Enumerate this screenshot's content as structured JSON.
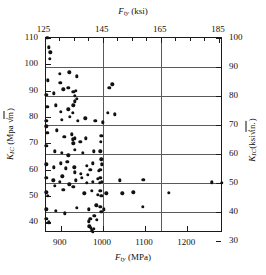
{
  "figure": {
    "top_axis_title_parts": {
      "sym": "F",
      "sub": "ty",
      "unit": " (ksi)"
    },
    "bottom_axis_title_parts": {
      "sym": "F",
      "sub": "ty",
      "unit": " (MPa)"
    },
    "left_axis_title_parts": {
      "sym": "K",
      "sub": "IC",
      "unit": " (Mpa ",
      "radical": "√",
      "radicand": "m",
      "close": ")"
    },
    "right_axis_title_parts": {
      "sym": "K",
      "sub": "IC",
      "unit": "(ksi",
      "radical": "√",
      "radicand": "in.",
      "close": ")"
    },
    "colors": {
      "frame": "#1a1a1a",
      "grid": "#5a5a5a",
      "marker": "#111111",
      "background": "#ffffff"
    }
  },
  "chart_data": {
    "type": "scatter",
    "title": "",
    "xlabel": "F_ty (MPa)",
    "ylabel": "K_IC (MPa √m)",
    "xlabel_top": "F_ty (ksi)",
    "ylabel_right": "K_IC (ksi√in.)",
    "grid": true,
    "legend": null,
    "xlim": [
      865,
      1285
    ],
    "ylim": [
      36,
      110
    ],
    "xlim_ksi": [
      125.5,
      186.4
    ],
    "ylim_ksiin": [
      32.8,
      100.1
    ],
    "xticks": [
      900,
      1000,
      1100,
      1200
    ],
    "xticklabels": [
      "900",
      "1000",
      "1100",
      "1200"
    ],
    "xticks_top_ksi": [
      125,
      145,
      165,
      185
    ],
    "xticklabels_top": [
      "125",
      "145",
      "165",
      "185"
    ],
    "xticks_top_minor_ksi": [
      130,
      135,
      140,
      150,
      155,
      160,
      170,
      175,
      180
    ],
    "yticks": [
      40,
      50,
      60,
      70,
      80,
      90,
      100,
      110
    ],
    "yticklabels": [
      "40",
      "50",
      "60",
      "70",
      "80",
      "90",
      "100",
      "110"
    ],
    "yticks_right_ksiin": [
      30,
      40,
      50,
      60,
      70,
      80,
      90,
      100
    ],
    "yticklabels_right": [
      "30",
      "40",
      "50",
      "60",
      "70",
      "80",
      "90",
      "100"
    ],
    "gridlines_h_ksiin": [
      40,
      50,
      60,
      70,
      80,
      90
    ],
    "gridlines_v_ksi": [
      145,
      165
    ],
    "unit_conversion": {
      "mpa_per_ksi": 6.895,
      "mparootm_per_ksirootin": 1.099
    },
    "points": [
      [
        868,
        110.0
      ],
      [
        872,
        106.5
      ],
      [
        875,
        104.5
      ],
      [
        874,
        102.0
      ],
      [
        870,
        94.0
      ],
      [
        898,
        96.5
      ],
      [
        899,
        93.0
      ],
      [
        920,
        97.0
      ],
      [
        938,
        95.5
      ],
      [
        866,
        88.5
      ],
      [
        884,
        89.0
      ],
      [
        906,
        90.5
      ],
      [
        918,
        91.0
      ],
      [
        930,
        89.5
      ],
      [
        933,
        88.0
      ],
      [
        934,
        86.0
      ],
      [
        936,
        90.0
      ],
      [
        938,
        87.0
      ],
      [
        1022,
        92.5
      ],
      [
        1015,
        91.0
      ],
      [
        868,
        84.0
      ],
      [
        888,
        84.5
      ],
      [
        900,
        82.0
      ],
      [
        918,
        83.0
      ],
      [
        928,
        81.5
      ],
      [
        930,
        84.5
      ],
      [
        866,
        78.5
      ],
      [
        902,
        79.0
      ],
      [
        922,
        80.0
      ],
      [
        940,
        78.5
      ],
      [
        958,
        79.5
      ],
      [
        982,
        78.5
      ],
      [
        1000,
        78.0
      ],
      [
        1012,
        81.5
      ],
      [
        1028,
        81.0
      ],
      [
        866,
        76.5
      ],
      [
        868,
        74.0
      ],
      [
        890,
        75.0
      ],
      [
        908,
        72.5
      ],
      [
        926,
        73.5
      ],
      [
        928,
        71.5
      ],
      [
        930,
        70.0
      ],
      [
        934,
        72.0
      ],
      [
        946,
        70.5
      ],
      [
        960,
        72.0
      ],
      [
        866,
        69.0
      ],
      [
        886,
        67.0
      ],
      [
        902,
        66.5
      ],
      [
        918,
        65.5
      ],
      [
        934,
        67.5
      ],
      [
        952,
        66.5
      ],
      [
        978,
        67.0
      ],
      [
        994,
        67.0
      ],
      [
        995,
        70.5
      ],
      [
        996,
        73.0
      ],
      [
        866,
        62.0
      ],
      [
        884,
        61.0
      ],
      [
        900,
        62.5
      ],
      [
        912,
        60.5
      ],
      [
        916,
        63.0
      ],
      [
        932,
        61.0
      ],
      [
        934,
        59.0
      ],
      [
        948,
        58.5
      ],
      [
        962,
        61.5
      ],
      [
        970,
        60.0
      ],
      [
        976,
        62.5
      ],
      [
        990,
        59.5
      ],
      [
        994,
        60.0
      ],
      [
        996,
        64.0
      ],
      [
        998,
        62.0
      ],
      [
        866,
        57.0
      ],
      [
        882,
        56.0
      ],
      [
        898,
        55.5
      ],
      [
        904,
        57.5
      ],
      [
        920,
        54.5
      ],
      [
        936,
        56.0
      ],
      [
        950,
        57.0
      ],
      [
        962,
        55.0
      ],
      [
        964,
        58.0
      ],
      [
        976,
        55.5
      ],
      [
        988,
        56.5
      ],
      [
        992,
        55.0
      ],
      [
        994,
        57.0
      ],
      [
        998,
        55.5
      ],
      [
        1040,
        56.0
      ],
      [
        1096,
        56.3
      ],
      [
        1258,
        55.3
      ],
      [
        1282,
        55.0
      ],
      [
        866,
        51.5
      ],
      [
        870,
        50.0
      ],
      [
        886,
        54.0
      ],
      [
        906,
        52.5
      ],
      [
        930,
        53.5
      ],
      [
        956,
        51.0
      ],
      [
        974,
        52.0
      ],
      [
        988,
        50.5
      ],
      [
        994,
        52.0
      ],
      [
        996,
        50.0
      ],
      [
        1008,
        51.0
      ],
      [
        1046,
        51.0
      ],
      [
        1072,
        51.5
      ],
      [
        1156,
        51.3
      ],
      [
        866,
        45.0
      ],
      [
        888,
        44.5
      ],
      [
        910,
        43.5
      ],
      [
        938,
        45.5
      ],
      [
        966,
        45.0
      ],
      [
        984,
        46.5
      ],
      [
        994,
        46.0
      ],
      [
        996,
        44.0
      ],
      [
        1002,
        45.0
      ],
      [
        1094,
        46.0
      ],
      [
        866,
        41.5
      ],
      [
        872,
        40.0
      ],
      [
        966,
        40.5
      ],
      [
        970,
        41.5
      ],
      [
        980,
        42.5
      ],
      [
        986,
        41.0
      ],
      [
        968,
        38.5
      ],
      [
        972,
        38.0
      ],
      [
        974,
        37.0
      ],
      [
        978,
        37.5
      ],
      [
        976,
        36.5
      ]
    ]
  }
}
